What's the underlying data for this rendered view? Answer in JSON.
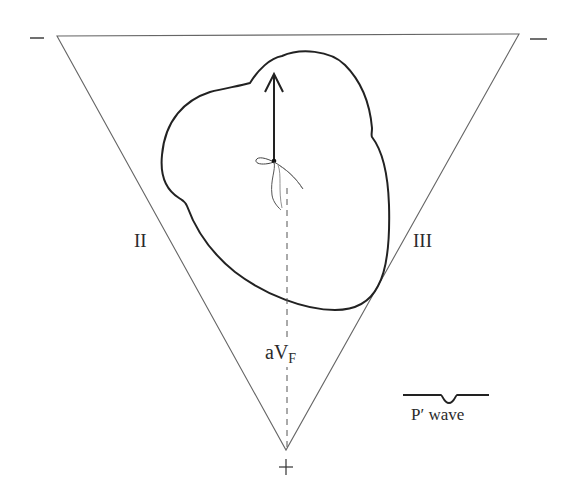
{
  "figure": {
    "type": "Einthoven triangle diagram with heart and P' wave vector",
    "colors": {
      "background": "#ffffff",
      "triangle_stroke": "#555555",
      "heart_stroke": "#222222",
      "arrow": "#222222",
      "dashed_line": "#555555"
    }
  },
  "triangle": {
    "vertices": {
      "top_left": [
        57,
        36
      ],
      "top_right": [
        519,
        34
      ],
      "bottom": [
        286,
        450
      ]
    }
  },
  "polarity": {
    "top_left": "−",
    "top_right": "−",
    "bottom": "+"
  },
  "leads": {
    "left_side": "II",
    "right_side": "III",
    "vertical": {
      "base": "aV",
      "subscript": "F"
    }
  },
  "vector": {
    "direction": "upward",
    "description": "arrow from AV junction pointing superiorly"
  },
  "legend": {
    "waveform": "inverted P wave",
    "label": "P′ wave"
  }
}
